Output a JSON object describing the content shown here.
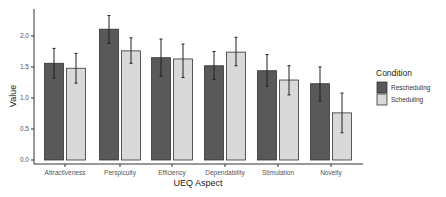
{
  "chart_data": {
    "type": "bar",
    "title": "",
    "xlabel": "UEQ Aspect",
    "ylabel": "Value",
    "ylim": [
      0,
      2.4
    ],
    "yticks": [
      "0.0",
      "0.5",
      "1.0",
      "1.5",
      "2.0"
    ],
    "grid": false,
    "legend_position": "right",
    "legend_title": "Condition",
    "categories": [
      "Attractiveness",
      "Perspicuity",
      "Efficiency",
      "Dependability",
      "Stimulation",
      "Novelty"
    ],
    "series": [
      {
        "name": "Rescheduling",
        "color": "#595959",
        "values": [
          1.56,
          2.11,
          1.65,
          1.52,
          1.44,
          1.23
        ],
        "error_low": [
          1.32,
          1.88,
          1.35,
          1.3,
          1.19,
          0.95
        ],
        "error_high": [
          1.8,
          2.33,
          1.95,
          1.75,
          1.7,
          1.5
        ]
      },
      {
        "name": "Scheduling",
        "color": "#d9d9d9",
        "values": [
          1.48,
          1.76,
          1.63,
          1.74,
          1.29,
          0.76
        ],
        "error_low": [
          1.24,
          1.56,
          1.33,
          1.52,
          1.05,
          0.44
        ],
        "error_high": [
          1.72,
          1.97,
          1.87,
          1.98,
          1.52,
          1.08
        ]
      }
    ]
  }
}
